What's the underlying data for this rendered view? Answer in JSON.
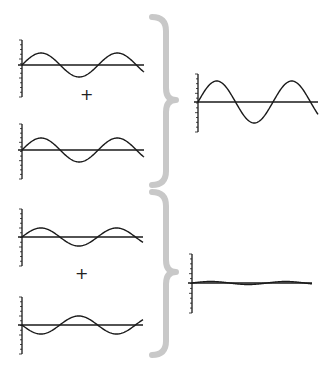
{
  "colors": {
    "curve": "#1a1a1a",
    "axis": "#1a1a1a",
    "brace": "#c8c8c8",
    "background": "#ffffff"
  },
  "operators": {
    "plus": "+"
  },
  "groups": [
    {
      "name": "constructive",
      "inputs": [
        {
          "x0": 22,
          "y0": 65,
          "len": 122,
          "amp": 12,
          "cycles": 1.6,
          "phase": 0,
          "axisTop": 40,
          "axisBottom": 97
        },
        {
          "x0": 22,
          "y0": 150,
          "len": 122,
          "amp": 12,
          "cycles": 1.6,
          "phase": 0,
          "axisTop": 124,
          "axisBottom": 179
        }
      ],
      "plus": {
        "x": 80,
        "y": 95
      },
      "brace": {
        "x": 152,
        "top": 17,
        "mid": 100,
        "bottom": 185,
        "tip": 176
      },
      "result": {
        "x0": 198,
        "y0": 102,
        "len": 120,
        "amp": 21,
        "cycles": 1.6,
        "phase": 0,
        "axisTop": 74,
        "axisBottom": 132
      }
    },
    {
      "name": "destructive",
      "inputs": [
        {
          "x0": 22,
          "y0": 237,
          "len": 121,
          "amp": 9,
          "cycles": 1.6,
          "phase": 0,
          "axisTop": 209,
          "axisBottom": 266
        },
        {
          "x0": 22,
          "y0": 325,
          "len": 121,
          "amp": 9,
          "cycles": 1.6,
          "phase": 180,
          "axisTop": 297,
          "axisBottom": 354
        }
      ],
      "plus": {
        "x": 75,
        "y": 274
      },
      "brace": {
        "x": 152,
        "top": 192,
        "mid": 272,
        "bottom": 355,
        "tip": 176
      },
      "result": {
        "x0": 192,
        "y0": 283,
        "len": 120,
        "amp": 1.5,
        "cycles": 1.6,
        "phase": 0,
        "axisTop": 254,
        "axisBottom": 313
      }
    }
  ]
}
